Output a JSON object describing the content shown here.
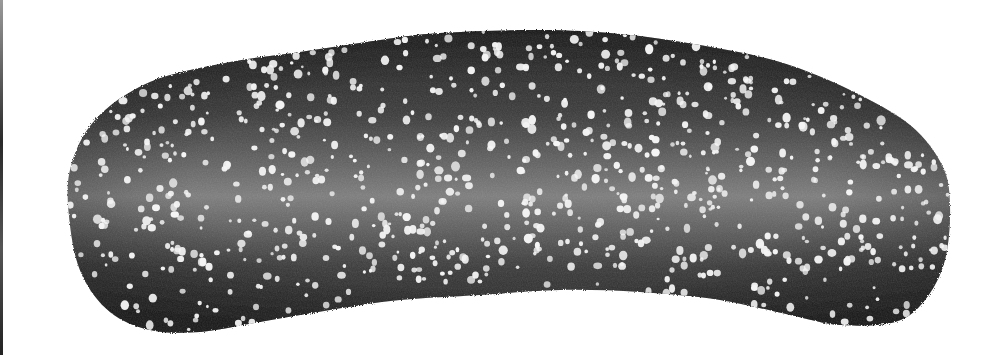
{
  "image": {
    "description": "Grayscale image of an elongated, slightly curved dark blob covered with scattered white speckles",
    "width": 1005,
    "height": 355,
    "background_color": "#ffffff",
    "shape": {
      "outline": [
        [
          70,
          170
        ],
        [
          95,
          120
        ],
        [
          150,
          82
        ],
        [
          230,
          62
        ],
        [
          300,
          52
        ],
        [
          380,
          40
        ],
        [
          440,
          33
        ],
        [
          540,
          30
        ],
        [
          620,
          34
        ],
        [
          700,
          45
        ],
        [
          780,
          62
        ],
        [
          850,
          90
        ],
        [
          910,
          125
        ],
        [
          942,
          165
        ],
        [
          950,
          205
        ],
        [
          945,
          260
        ],
        [
          925,
          300
        ],
        [
          895,
          322
        ],
        [
          840,
          325
        ],
        [
          790,
          315
        ],
        [
          720,
          300
        ],
        [
          640,
          292
        ],
        [
          560,
          290
        ],
        [
          480,
          295
        ],
        [
          400,
          300
        ],
        [
          330,
          310
        ],
        [
          260,
          322
        ],
        [
          200,
          332
        ],
        [
          150,
          330
        ],
        [
          110,
          312
        ],
        [
          82,
          275
        ],
        [
          70,
          225
        ]
      ],
      "edge_color": "#1a1a1a",
      "center_color": "#8a8a8a",
      "mid_color": "#4a4a4a"
    },
    "speckles": {
      "count": 900,
      "color": "#f4f4f4",
      "min_radius": 1.5,
      "max_radius": 4.2,
      "seed": 17
    },
    "left_edge_line_color": "#2a2a2a"
  }
}
